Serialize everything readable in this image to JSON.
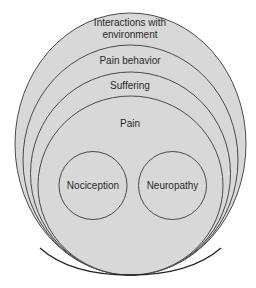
{
  "diagram": {
    "type": "nested-ellipses",
    "colors": {
      "fill": "#d8d8d8",
      "stroke": "#4a4a4a",
      "text": "#2a2a2a",
      "background": "#ffffff"
    },
    "layers": [
      {
        "id": "interactions",
        "label": "Interactions with environment",
        "line1": "Interactions with",
        "line2": "environment"
      },
      {
        "id": "pain-behavior",
        "label": "Pain behavior"
      },
      {
        "id": "suffering",
        "label": "Suffering"
      },
      {
        "id": "pain",
        "label": "Pain"
      }
    ],
    "inner_circles": [
      {
        "id": "nociception",
        "label": "Nociception"
      },
      {
        "id": "neuropathy",
        "label": "Neuropathy"
      }
    ]
  }
}
